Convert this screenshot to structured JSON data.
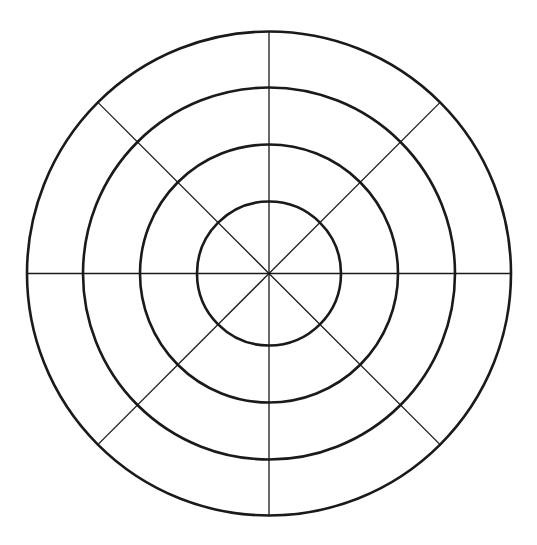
{
  "title": "",
  "diagram": {
    "type": "polar-grid",
    "center": [
      269,
      273.5
    ],
    "ring_radii": [
      72,
      129,
      186,
      242
    ],
    "spoke_angles_deg": [
      0,
      45,
      90,
      135,
      180,
      225,
      270,
      315
    ],
    "stroke_color": "#1a1a1a",
    "background": "#ffffff"
  }
}
